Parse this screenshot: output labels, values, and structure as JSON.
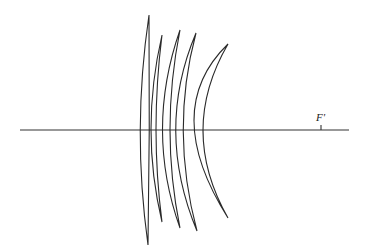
{
  "diagram": {
    "type": "optical-lens-system",
    "focal_point_label": "F'",
    "colors": {
      "stroke": "#2a2a2a",
      "background": "#ffffff"
    },
    "elements_count": 5
  }
}
